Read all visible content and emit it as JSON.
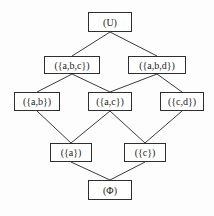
{
  "diagram": {
    "type": "lattice (Hasse diagram)",
    "nodes": [
      {
        "id": "U",
        "label": "(U)",
        "x": 88,
        "y": 12,
        "w": 44,
        "h": 20
      },
      {
        "id": "abc",
        "label": "({a,b,c})",
        "x": 44,
        "y": 56,
        "w": 56,
        "h": 18
      },
      {
        "id": "abd",
        "label": "({a,b,d})",
        "x": 128,
        "y": 56,
        "w": 58,
        "h": 18
      },
      {
        "id": "ab",
        "label": "({a,b})",
        "x": 14,
        "y": 92,
        "w": 46,
        "h": 19
      },
      {
        "id": "ac",
        "label": "({a,c})",
        "x": 88,
        "y": 92,
        "w": 44,
        "h": 19
      },
      {
        "id": "cd",
        "label": "({c,d})",
        "x": 160,
        "y": 92,
        "w": 44,
        "h": 19
      },
      {
        "id": "a",
        "label": "({a})",
        "x": 50,
        "y": 143,
        "w": 42,
        "h": 19
      },
      {
        "id": "c",
        "label": "({c})",
        "x": 124,
        "y": 143,
        "w": 42,
        "h": 19
      },
      {
        "id": "phi",
        "label": "(Φ)",
        "x": 88,
        "y": 180,
        "w": 44,
        "h": 20
      }
    ],
    "edges": [
      {
        "from": "U",
        "to": "abc"
      },
      {
        "from": "U",
        "to": "abd"
      },
      {
        "from": "abc",
        "to": "ab"
      },
      {
        "from": "abc",
        "to": "ac"
      },
      {
        "from": "abd",
        "to": "ac"
      },
      {
        "from": "abd",
        "to": "cd"
      },
      {
        "from": "ab",
        "to": "a"
      },
      {
        "from": "ac",
        "to": "a"
      },
      {
        "from": "ac",
        "to": "c"
      },
      {
        "from": "cd",
        "to": "c"
      },
      {
        "from": "a",
        "to": "phi"
      },
      {
        "from": "c",
        "to": "phi"
      }
    ]
  }
}
